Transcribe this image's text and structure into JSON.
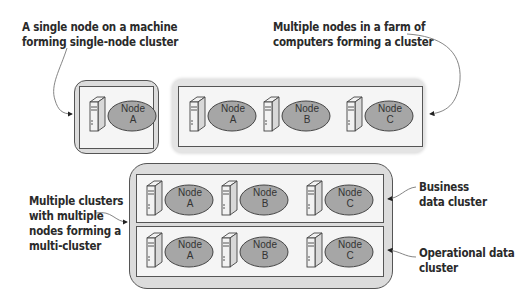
{
  "annotations": {
    "single_node": [
      "A single node on a machine",
      "forming single-node cluster"
    ],
    "farm": [
      "Multiple nodes in a farm of",
      "computers forming a cluster"
    ],
    "multi_cluster": [
      "Multiple clusters",
      "with multiple",
      "nodes forming a",
      "multi-cluster"
    ],
    "business": [
      "Business",
      "data cluster"
    ],
    "operational": [
      "Operational data",
      "cluster"
    ]
  },
  "clusters": {
    "single": {
      "nodes": [
        {
          "name": "Node",
          "id": "A"
        }
      ]
    },
    "farm": {
      "nodes": [
        {
          "name": "Node",
          "id": "A"
        },
        {
          "name": "Node",
          "id": "B"
        },
        {
          "name": "Node",
          "id": "C"
        }
      ]
    },
    "business": {
      "nodes": [
        {
          "name": "Node",
          "id": "A"
        },
        {
          "name": "Node",
          "id": "B"
        },
        {
          "name": "Node",
          "id": "C"
        }
      ]
    },
    "operational": {
      "nodes": [
        {
          "name": "Node",
          "id": "A"
        },
        {
          "name": "Node",
          "id": "B"
        },
        {
          "name": "Node",
          "id": "C"
        }
      ]
    }
  },
  "colors": {
    "ellipse_fill": "#a6a6a6",
    "outer_box": "#dcdcdc",
    "inner_box": "#f5f5f5",
    "border": "#555555",
    "text": "#2a2a2a"
  }
}
